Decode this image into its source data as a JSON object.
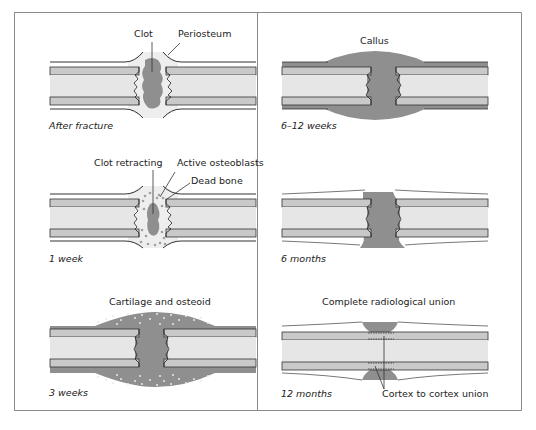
{
  "figure": {
    "colors": {
      "cortex": "#c9c9c9",
      "marrow": "#e6e6e6",
      "soft_tissue": "#ededed",
      "callus": "#8f8f8f",
      "outline": "#333333",
      "border": "#8a8a8a"
    },
    "panels": [
      {
        "id": "after-fracture",
        "caption": "After fracture",
        "labels": [
          "Clot",
          "Periosteum"
        ]
      },
      {
        "id": "6-12-weeks",
        "caption": "6–12 weeks",
        "labels": [
          "Callus"
        ]
      },
      {
        "id": "1-week",
        "caption": "1 week",
        "labels": [
          "Clot retracting",
          "Active osteoblasts",
          "Dead bone"
        ]
      },
      {
        "id": "6-months",
        "caption": "6 months",
        "labels": []
      },
      {
        "id": "3-weeks",
        "caption": "3 weeks",
        "labels": [
          "Cartilage and osteoid"
        ]
      },
      {
        "id": "12-months",
        "caption": "12 months",
        "labels": [
          "Complete radiological union",
          "Cortex to cortex union"
        ]
      }
    ]
  }
}
